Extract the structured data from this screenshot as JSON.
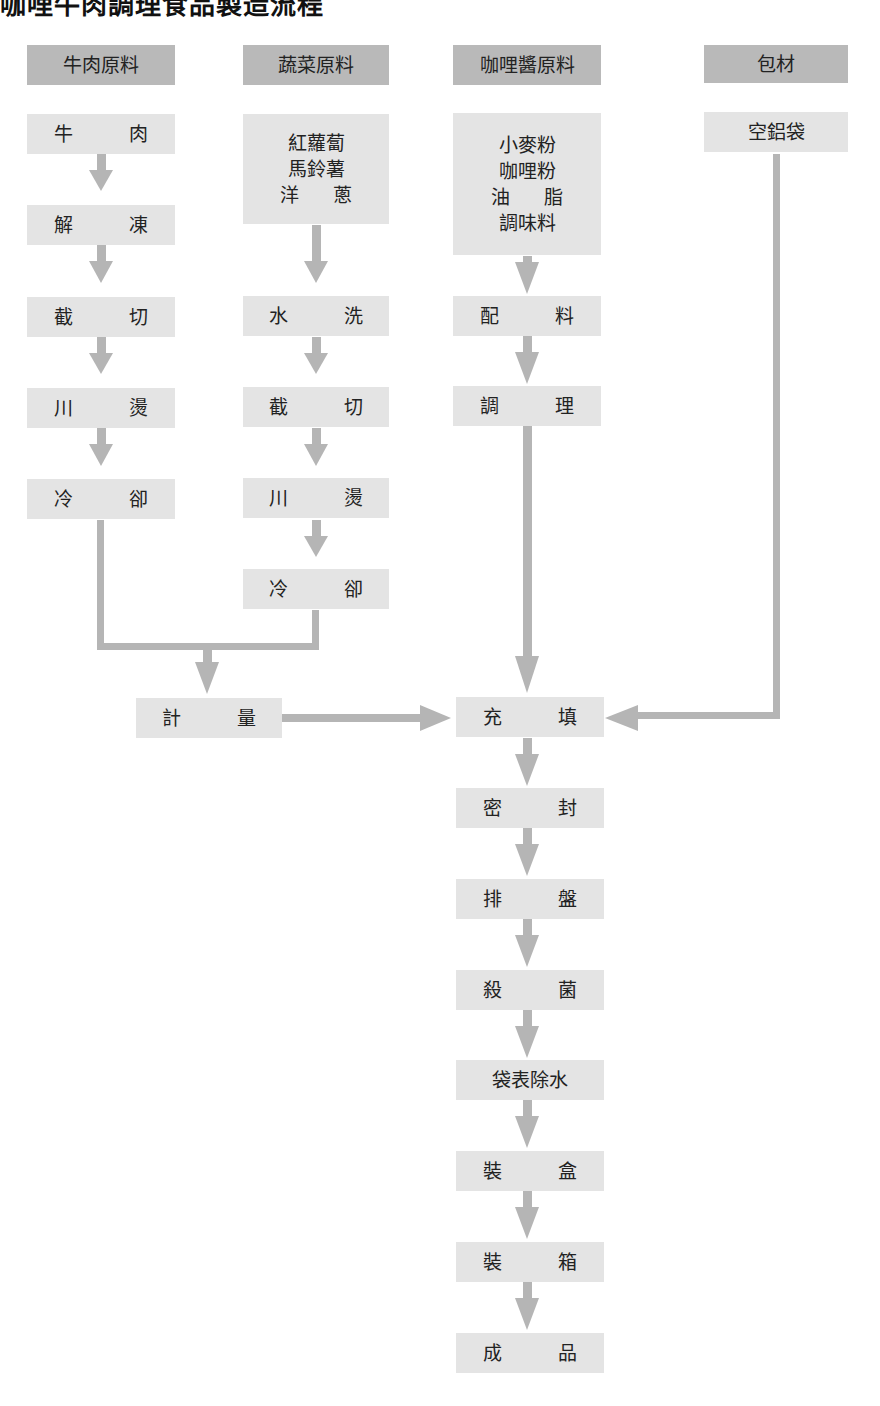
{
  "title": "咖哩牛肉調理食品製造流程",
  "colors": {
    "header_fill": "#b9b9b9",
    "box_fill": "#e4e4e4",
    "arrow": "#b5b5b5",
    "text": "#222222"
  },
  "columns": [
    {
      "header": "牛肉原料",
      "steps": [
        [
          "牛",
          "肉"
        ],
        [
          "解",
          "凍"
        ],
        [
          "截",
          "切"
        ],
        [
          "川",
          "燙"
        ],
        [
          "冷",
          "卻"
        ]
      ]
    },
    {
      "header": "蔬菜原料",
      "ingredients": [
        "紅蘿蔔",
        "馬鈴薯",
        [
          "洋",
          "蔥"
        ]
      ],
      "steps": [
        [
          "水",
          "洗"
        ],
        [
          "截",
          "切"
        ],
        [
          "川",
          "燙"
        ],
        [
          "冷",
          "卻"
        ]
      ]
    },
    {
      "header": "咖哩醬原料",
      "ingredients": [
        "小麥粉",
        "咖哩粉",
        [
          "油",
          "脂"
        ],
        "調味料"
      ],
      "steps": [
        [
          "配",
          "料"
        ],
        [
          "調",
          "理"
        ]
      ]
    },
    {
      "header": "包材",
      "ingredients": [
        "空鋁袋"
      ]
    }
  ],
  "merge_step": [
    "計",
    "量"
  ],
  "main_line": [
    [
      "充",
      "填"
    ],
    [
      "密",
      "封"
    ],
    [
      "排",
      "盤"
    ],
    [
      "殺",
      "菌"
    ],
    "袋表除水",
    [
      "裝",
      "盒"
    ],
    [
      "裝",
      "箱"
    ],
    [
      "成",
      "品"
    ]
  ]
}
